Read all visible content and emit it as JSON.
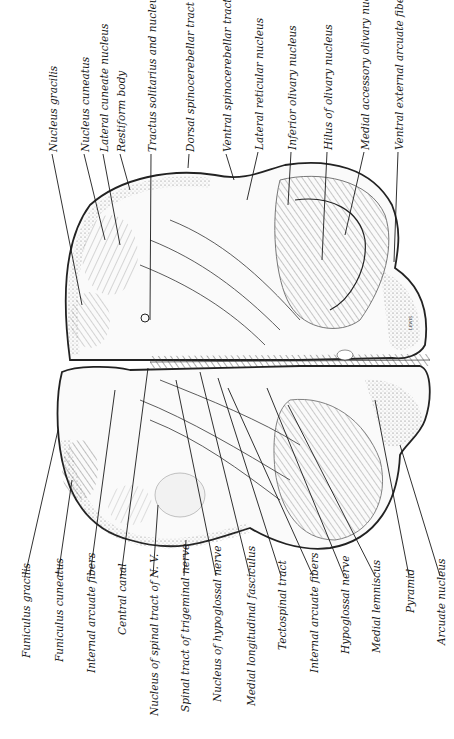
{
  "figure": {
    "colors": {
      "ink": "#1a1a1a",
      "paper": "#ffffff",
      "shading": "#8a8a8a"
    },
    "top_labels": [
      {
        "text": "Nucleus gracilis",
        "x": 47,
        "y": 152,
        "tx": 82,
        "ty": 305
      },
      {
        "text": "Nucleus cuneatus",
        "x": 79,
        "y": 152,
        "tx": 105,
        "ty": 240
      },
      {
        "text": "Lateral cuneate nucleus",
        "x": 98,
        "y": 152,
        "tx": 120,
        "ty": 245
      },
      {
        "text": "Restiform body",
        "x": 115,
        "y": 152,
        "tx": 130,
        "ty": 190
      },
      {
        "text": "Tractus solitarius and nucleus",
        "x": 146,
        "y": 152,
        "tx": 150,
        "ty": 320
      },
      {
        "text": "Dorsal spinocerebellar tract",
        "x": 184,
        "y": 152,
        "tx": 188,
        "ty": 168
      },
      {
        "text": "Ventral spinocerebellar tract",
        "x": 221,
        "y": 152,
        "tx": 234,
        "ty": 180
      },
      {
        "text": "Lateral reticular nucleus",
        "x": 253,
        "y": 150,
        "tx": 247,
        "ty": 200
      },
      {
        "text": "Inferior olivary nucleus",
        "x": 286,
        "y": 150,
        "tx": 288,
        "ty": 205
      },
      {
        "text": "Hilus of olivary nucleus",
        "x": 322,
        "y": 150,
        "tx": 322,
        "ty": 260
      },
      {
        "text": "Medial accessory olivary nucleus",
        "x": 359,
        "y": 150,
        "tx": 345,
        "ty": 235
      },
      {
        "text": "Ventral external arcuate fibers",
        "x": 393,
        "y": 150,
        "tx": 394,
        "ty": 262
      }
    ],
    "bottom_labels": [
      {
        "text": "Funiculus gracilis",
        "x": 20,
        "y": 658,
        "tx": 58,
        "ty": 430
      },
      {
        "text": "Funiculus cuneatus",
        "x": 53,
        "y": 662,
        "tx": 72,
        "ty": 480
      },
      {
        "text": "Internal arcuate fibers",
        "x": 85,
        "y": 673,
        "tx": 115,
        "ty": 390
      },
      {
        "text": "Central canal",
        "x": 116,
        "y": 635,
        "tx": 148,
        "ty": 368
      },
      {
        "text": "Nucleus of spinal tract of N. V.",
        "x": 148,
        "y": 716,
        "tx": 158,
        "ty": 505
      },
      {
        "text": "Spinal tract of trigeminal nerve",
        "x": 179,
        "y": 712,
        "tx": 186,
        "ty": 540
      },
      {
        "text": "Nucleus of hypoglossal nerve",
        "x": 211,
        "y": 702,
        "tx": 176,
        "ty": 380
      },
      {
        "text": "Medial longitudinal fasciculus",
        "x": 245,
        "y": 706,
        "tx": 200,
        "ty": 372
      },
      {
        "text": "Tectospinal tract",
        "x": 276,
        "y": 650,
        "tx": 218,
        "ty": 378
      },
      {
        "text": "Internal arcuate fibers",
        "x": 308,
        "y": 673,
        "tx": 228,
        "ty": 388
      },
      {
        "text": "Hypoglossal nerve",
        "x": 339,
        "y": 654,
        "tx": 267,
        "ty": 388
      },
      {
        "text": "Medial lemniscus",
        "x": 370,
        "y": 653,
        "tx": 288,
        "ty": 405
      },
      {
        "text": "Pyramid",
        "x": 404,
        "y": 613,
        "tx": 375,
        "ty": 400
      },
      {
        "text": "Arcuate nucleus",
        "x": 435,
        "y": 645,
        "tx": 400,
        "ty": 445
      }
    ],
    "signature": "LEWIS"
  }
}
